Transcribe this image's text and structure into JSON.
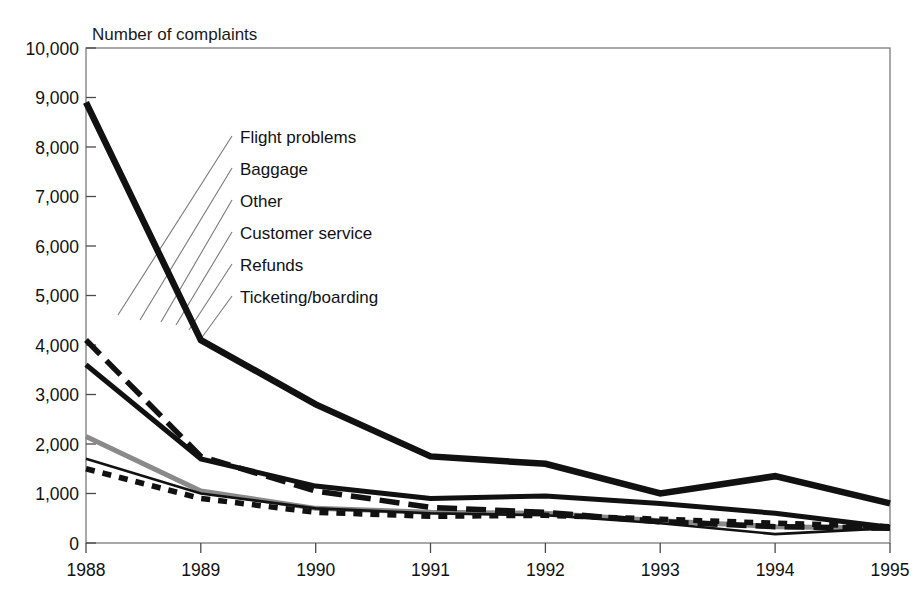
{
  "chart_data": {
    "type": "line",
    "title": "Number of complaints",
    "xlabel": "",
    "ylabel": "Number of complaints",
    "grid": false,
    "legend_position": "inline-leader-labels",
    "x": [
      "1988",
      "1989",
      "1990",
      "1991",
      "1992",
      "1993",
      "1994",
      "1995"
    ],
    "xlim": [
      1988,
      1995
    ],
    "ylim": [
      0,
      10000
    ],
    "ytick_labels": [
      "0",
      "1,000",
      "2,000",
      "3,000",
      "4,000",
      "5,000",
      "6,000",
      "7,000",
      "8,000",
      "9,000",
      "10,000"
    ],
    "ytick_values": [
      0,
      1000,
      2000,
      3000,
      4000,
      5000,
      6000,
      7000,
      8000,
      9000,
      10000
    ],
    "xtick_labels": [
      "1988",
      "1989",
      "1990",
      "1991",
      "1992",
      "1993",
      "1994",
      "1995"
    ],
    "series": [
      {
        "name": "Flight problems",
        "style": "thick-solid",
        "color": "#111111",
        "values": [
          8900,
          4100,
          2800,
          1750,
          1600,
          1000,
          1350,
          800
        ]
      },
      {
        "name": "Baggage",
        "style": "thick-dashed",
        "color": "#111111",
        "values": [
          4100,
          1750,
          1050,
          720,
          620,
          430,
          330,
          300
        ]
      },
      {
        "name": "Other",
        "style": "thick-solid-dark",
        "color": "#111111",
        "values": [
          3600,
          1700,
          1150,
          900,
          950,
          800,
          600,
          320
        ]
      },
      {
        "name": "Customer service",
        "style": "gray-solid",
        "color": "#8a8a8a",
        "values": [
          2150,
          1050,
          700,
          620,
          600,
          450,
          330,
          300
        ]
      },
      {
        "name": "Refunds",
        "style": "thin-solid",
        "color": "#111111",
        "values": [
          1700,
          1000,
          700,
          600,
          560,
          400,
          180,
          300
        ]
      },
      {
        "name": "Ticketing/boarding",
        "style": "dotted",
        "color": "#111111",
        "values": [
          1500,
          900,
          620,
          540,
          560,
          480,
          400,
          330
        ]
      }
    ]
  },
  "labels": {
    "axis_title": "Number of complaints",
    "series_names": [
      "Flight problems",
      "Baggage",
      "Other",
      "Customer service",
      "Refunds",
      "Ticketing/boarding"
    ]
  },
  "yticks": {
    "t0": "0",
    "t1": "1,000",
    "t2": "2,000",
    "t3": "3,000",
    "t4": "4,000",
    "t5": "5,000",
    "t6": "6,000",
    "t7": "7,000",
    "t8": "8,000",
    "t9": "9,000",
    "t10": "10,000"
  },
  "xticks": {
    "x0": "1988",
    "x1": "1989",
    "x2": "1990",
    "x3": "1991",
    "x4": "1992",
    "x5": "1993",
    "x6": "1994",
    "x7": "1995"
  }
}
